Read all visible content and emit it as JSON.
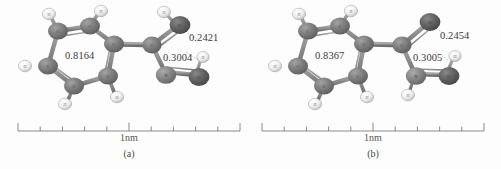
{
  "figure": {
    "background_color": "#fdfdfd",
    "panels": [
      {
        "id": "a",
        "caption": "(a)",
        "scale_label": "1nm",
        "labels": {
          "ring_distance": "0.8164",
          "upper_distance": "0.2421",
          "lower_distance": "0.3004"
        },
        "atoms": [
          {
            "element": "C",
            "label": "C",
            "type": "carbon"
          },
          {
            "element": "C",
            "label": "C",
            "type": "carbon"
          },
          {
            "element": "C",
            "label": "C",
            "type": "carbon"
          },
          {
            "element": "C",
            "label": "C",
            "type": "carbon"
          },
          {
            "element": "C",
            "label": "C",
            "type": "carbon"
          },
          {
            "element": "C",
            "label": "C",
            "type": "carbon"
          },
          {
            "element": "H",
            "label": "H",
            "type": "hydrogen"
          },
          {
            "element": "H",
            "label": "H",
            "type": "hydrogen"
          },
          {
            "element": "H",
            "label": "H",
            "type": "hydrogen"
          },
          {
            "element": "H",
            "label": "H",
            "type": "hydrogen"
          },
          {
            "element": "H",
            "label": "H",
            "type": "hydrogen"
          },
          {
            "element": "C",
            "label": "C",
            "type": "carbon"
          },
          {
            "element": "O",
            "label": "O",
            "type": "oxygen"
          },
          {
            "element": "H",
            "label": "H",
            "type": "hydrogen"
          },
          {
            "element": "N",
            "label": "N",
            "type": "nitrogen"
          },
          {
            "element": "O",
            "label": "O",
            "type": "oxygen"
          },
          {
            "element": "H",
            "label": "H",
            "type": "hydrogen"
          }
        ],
        "scale_ticks": 11
      },
      {
        "id": "b",
        "caption": "(b)",
        "scale_label": "1nm",
        "labels": {
          "ring_distance": "0.8367",
          "upper_distance": "0.2454",
          "lower_distance": "0.3005"
        },
        "atoms": [
          {
            "element": "C",
            "label": "C",
            "type": "carbon"
          },
          {
            "element": "C",
            "label": "C",
            "type": "carbon"
          },
          {
            "element": "C",
            "label": "C",
            "type": "carbon"
          },
          {
            "element": "C",
            "label": "C",
            "type": "carbon"
          },
          {
            "element": "C",
            "label": "C",
            "type": "carbon"
          },
          {
            "element": "C",
            "label": "C",
            "type": "carbon"
          },
          {
            "element": "H",
            "label": "H",
            "type": "hydrogen"
          },
          {
            "element": "H",
            "label": "H",
            "type": "hydrogen"
          },
          {
            "element": "H",
            "label": "H",
            "type": "hydrogen"
          },
          {
            "element": "H",
            "label": "H",
            "type": "hydrogen"
          },
          {
            "element": "H",
            "label": "H",
            "type": "hydrogen"
          },
          {
            "element": "C",
            "label": "C",
            "type": "carbon"
          },
          {
            "element": "O",
            "label": "O",
            "type": "oxygen"
          },
          {
            "element": "N",
            "label": "N",
            "type": "nitrogen"
          },
          {
            "element": "H",
            "label": "H",
            "type": "hydrogen"
          },
          {
            "element": "O",
            "label": "O",
            "type": "oxygen"
          },
          {
            "element": "H",
            "label": "H",
            "type": "hydrogen"
          }
        ],
        "scale_ticks": 11
      }
    ],
    "colors": {
      "carbon": "#7b7b7b",
      "nitrogen": "#828282",
      "oxygen": "#616161",
      "hydrogen": "#e9e9e9",
      "bond": "#8d8d8d",
      "text": "#3b3b3b",
      "axis": "#777777"
    }
  }
}
